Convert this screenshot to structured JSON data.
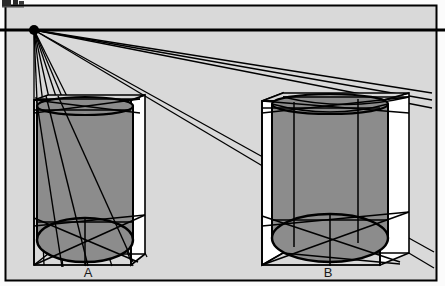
{
  "figure": {
    "background_color": "#d9d9d9",
    "paper_color": "#ffffff",
    "line_color": "#000000",
    "cylinder_fill": "#8c8c8c",
    "box_side_fill": "#ffffff",
    "frame": {
      "x": 5,
      "y": 5,
      "width": 432,
      "height": 276,
      "stroke_width": 2
    },
    "corner_artifact": {
      "present": true,
      "x": 2,
      "y": 0,
      "width": 22,
      "height": 7,
      "color": "#2b2b2b"
    }
  },
  "horizon": {
    "label": "horizon-line",
    "y": 30,
    "x_start": 0,
    "x_end": 445,
    "stroke_width": 3
  },
  "vanishing_point": {
    "label": "vanishing-point",
    "x": 34,
    "y": 30,
    "radius": 5
  },
  "rays": {
    "count": 12,
    "stroke_width": 1.3,
    "endpoints": [
      [
        43,
        265
      ],
      [
        63,
        265
      ],
      [
        95,
        265
      ],
      [
        130,
        268
      ],
      [
        155,
        113
      ],
      [
        158,
        101
      ],
      [
        408,
        99
      ],
      [
        430,
        96
      ],
      [
        430,
        124
      ],
      [
        415,
        126
      ],
      [
        418,
        256
      ],
      [
        425,
        264
      ]
    ]
  },
  "cylinders": [
    {
      "id": "A",
      "label": "A",
      "label_x": 88,
      "label_y": 276,
      "box": {
        "front_left_x": 34,
        "front_right_x": 131,
        "top_y": 100,
        "bottom_y": 265,
        "back_left_x": 44,
        "back_right_x": 145,
        "back_top_y": 95,
        "back_bottom_y": 254,
        "side_panel_fill": "#ffffff"
      },
      "cylinder": {
        "center_x": 85,
        "radius_x": 48,
        "top_y": 106,
        "bottom_y": 240,
        "top_ellipse_ry": 9,
        "bottom_ellipse_ry": 22,
        "fill": "#8c8c8c"
      }
    },
    {
      "id": "B",
      "label": "B",
      "label_x": 328,
      "label_y": 276,
      "box": {
        "front_left_x": 262,
        "front_right_x": 380,
        "top_y": 101,
        "bottom_y": 265,
        "back_left_x": 283,
        "back_right_x": 409,
        "back_top_y": 93,
        "back_bottom_y": 253,
        "side_panel_fill": "#ffffff"
      },
      "cylinder": {
        "center_x": 330,
        "radius_x": 58,
        "top_y": 104,
        "bottom_y": 238,
        "top_ellipse_ry": 10,
        "bottom_ellipse_ry": 24,
        "fill": "#8c8c8c"
      }
    }
  ],
  "labels": {
    "cylinder_a": "A",
    "cylinder_b": "B"
  }
}
